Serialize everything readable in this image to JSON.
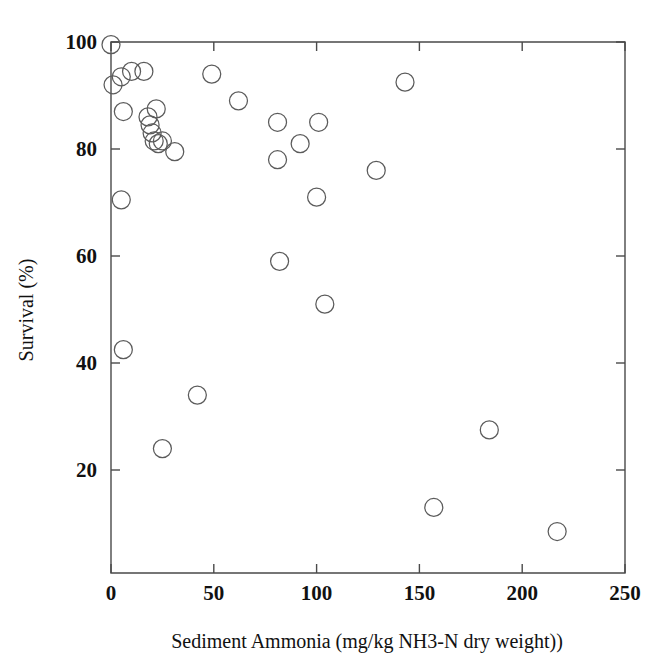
{
  "chart_data": {
    "type": "scatter",
    "title": "",
    "xlabel": "Sediment Ammonia (mg/kg NH3-N dry weight))",
    "ylabel": "Survival (%)",
    "xlim": [
      0,
      250
    ],
    "ylim": [
      0,
      102
    ],
    "xticks": [
      0,
      50,
      100,
      150,
      200,
      250
    ],
    "xticklabels": [
      "0",
      "50",
      "100",
      "150",
      "200",
      "250"
    ],
    "yticks": [
      20,
      40,
      60,
      80,
      100
    ],
    "yticklabels": [
      "20",
      "40",
      "60",
      "80",
      "100"
    ],
    "grid": false,
    "legend": null,
    "marker": {
      "shape": "circle-open",
      "radius_px": 9,
      "edge_color": "#5b5b5b",
      "face_color": "none"
    },
    "series": [
      {
        "name": "Survival vs Sediment Ammonia",
        "points": [
          {
            "x": 0,
            "y": 99.5
          },
          {
            "x": 1,
            "y": 92.0
          },
          {
            "x": 5,
            "y": 93.5
          },
          {
            "x": 10,
            "y": 94.5
          },
          {
            "x": 16,
            "y": 94.5
          },
          {
            "x": 6,
            "y": 87.0
          },
          {
            "x": 5,
            "y": 70.5
          },
          {
            "x": 6,
            "y": 42.5
          },
          {
            "x": 18,
            "y": 86.0
          },
          {
            "x": 19,
            "y": 84.5
          },
          {
            "x": 22,
            "y": 87.5
          },
          {
            "x": 20,
            "y": 83.0
          },
          {
            "x": 21,
            "y": 81.5
          },
          {
            "x": 23,
            "y": 81.0
          },
          {
            "x": 25,
            "y": 81.5
          },
          {
            "x": 31,
            "y": 79.5
          },
          {
            "x": 25,
            "y": 24.0
          },
          {
            "x": 42,
            "y": 34.0
          },
          {
            "x": 49,
            "y": 94.0
          },
          {
            "x": 62,
            "y": 89.0
          },
          {
            "x": 81,
            "y": 85.0
          },
          {
            "x": 81,
            "y": 78.0
          },
          {
            "x": 82,
            "y": 59.0
          },
          {
            "x": 92,
            "y": 81.0
          },
          {
            "x": 101,
            "y": 85.0
          },
          {
            "x": 100,
            "y": 71.0
          },
          {
            "x": 104,
            "y": 51.0
          },
          {
            "x": 129,
            "y": 76.0
          },
          {
            "x": 143,
            "y": 92.5
          },
          {
            "x": 157,
            "y": 13.0
          },
          {
            "x": 184,
            "y": 27.5
          },
          {
            "x": 217,
            "y": 8.5
          }
        ]
      }
    ]
  }
}
